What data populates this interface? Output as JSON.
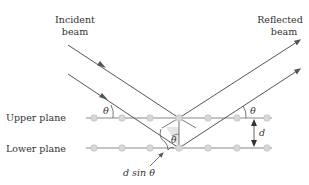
{
  "diagram": {
    "labels": {
      "incident_line1": "Incident",
      "incident_line2": "beam",
      "reflected_line1": "Reflected",
      "reflected_line2": "beam",
      "upper_plane": "Upper plane",
      "lower_plane": "Lower plane",
      "theta": "θ",
      "spacing": "d",
      "path_difference": "d sin θ"
    },
    "colors": {
      "line": "#555555",
      "plane": "#888888",
      "atom": "#d8d8d8",
      "atom_stroke": "#bbbbbb",
      "text": "#333333",
      "wedge": "#e6e6e6"
    },
    "atoms_x": [
      94,
      122,
      150,
      179,
      208,
      237,
      267
    ],
    "plane_y": {
      "upper": 118,
      "lower": 148
    }
  }
}
